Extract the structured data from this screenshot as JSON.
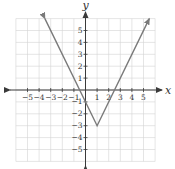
{
  "chart_data": {
    "type": "line",
    "title": "",
    "xlabel": "x",
    "ylabel": "y",
    "xlim": [
      -6,
      6
    ],
    "ylim": [
      -6,
      6
    ],
    "grid": true,
    "x_ticks": [
      -5,
      -4,
      -3,
      -2,
      -1,
      1,
      2,
      3,
      4,
      5
    ],
    "y_ticks": [
      5,
      4,
      3,
      2,
      1,
      -1,
      -2,
      -3,
      -4,
      -5
    ],
    "x_tick_labels": [
      "−5",
      "−4",
      "−3",
      "−2",
      "−1",
      "1",
      "2",
      "3",
      "4",
      "5"
    ],
    "y_tick_labels": [
      "5",
      "4",
      "3",
      "2",
      "1",
      "−1",
      "−2",
      "−3",
      "−4",
      "−5"
    ],
    "series": [
      {
        "name": "y = 2|x − 1| − 3",
        "x": [
          -3.5,
          1,
          5.5
        ],
        "y": [
          6,
          -3,
          6
        ],
        "arrows_at_ends": true,
        "color": "#7a7a7a"
      }
    ],
    "annotations": {
      "vertex": [
        1,
        -3
      ],
      "x_intercepts": [
        -0.5,
        2.5
      ],
      "y_intercept": -1
    }
  },
  "labels": {
    "x_axis": "x",
    "y_axis": "y"
  }
}
